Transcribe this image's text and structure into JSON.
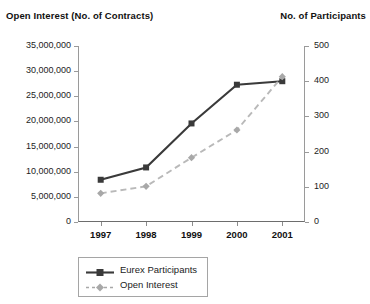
{
  "chart_data": {
    "type": "line",
    "title": "",
    "categories": [
      "1997",
      "1998",
      "1999",
      "2000",
      "2001"
    ],
    "xlabel": "",
    "grid": false,
    "legend_position": "bottom",
    "axes": {
      "left": {
        "label": "Open Interest (No. of Contracts)",
        "min": 0,
        "max": 35000000,
        "step": 5000000,
        "ticks": [
          "0",
          "5,000,000",
          "10,000,000",
          "15,000,000",
          "20,000,000",
          "25,000,000",
          "30,000,000",
          "35,000,000"
        ],
        "tick_values": [
          0,
          5000000,
          10000000,
          15000000,
          20000000,
          25000000,
          30000000,
          35000000
        ]
      },
      "right": {
        "label": "No. of Participants",
        "min": 0,
        "max": 500,
        "step": 100,
        "ticks": [
          "0",
          "100",
          "200",
          "300",
          "400",
          "500"
        ],
        "tick_values": [
          0,
          100,
          200,
          300,
          400,
          500
        ]
      }
    },
    "series": [
      {
        "name": "Eurex Participants",
        "axis": "right",
        "color": "#3a3a3a",
        "marker": "square",
        "dash": false,
        "values": [
          120,
          155,
          280,
          390,
          400
        ]
      },
      {
        "name": "Open Interest",
        "axis": "left",
        "color": "#a8a8a8",
        "marker": "diamond",
        "dash": true,
        "values": [
          5700000,
          7100000,
          12800000,
          18300000,
          28900000
        ]
      }
    ]
  },
  "legend": {
    "items": [
      {
        "label": "Eurex Participants"
      },
      {
        "label": "Open Interest"
      }
    ]
  }
}
